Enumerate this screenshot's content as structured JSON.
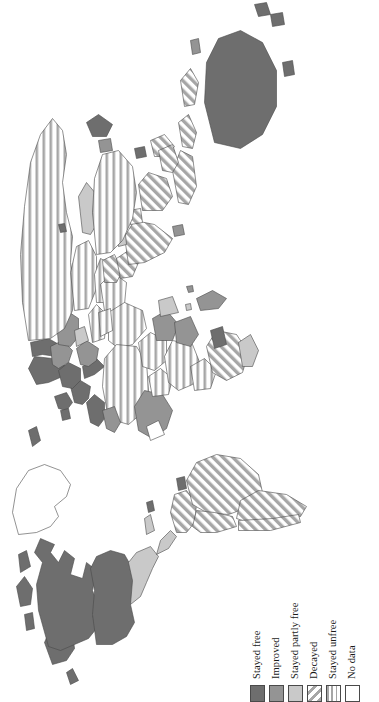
{
  "figure": {
    "type": "choropleth-world-map",
    "orientation": "rotated-90-ccw",
    "background_color": "#ffffff",
    "outline_color": "#4a4a4a"
  },
  "legend": {
    "name": "map-legend",
    "items": [
      {
        "label": "Stayed free",
        "fill": "solid",
        "color": "#6e6e6e"
      },
      {
        "label": "Improved",
        "fill": "solid",
        "color": "#949494"
      },
      {
        "label": "Stayed partly free",
        "fill": "solid",
        "color": "#c9c9c9"
      },
      {
        "label": "Decayed",
        "fill": "diagonal",
        "color": "#a0a0a0"
      },
      {
        "label": "Stayed unfree",
        "fill": "horizontal",
        "color": "#a0a0a0"
      },
      {
        "label": "No data",
        "fill": "none",
        "color": "#ffffff"
      }
    ]
  },
  "regions": [
    {
      "name": "canada",
      "category": "Stayed free"
    },
    {
      "name": "united-states",
      "category": "Stayed free"
    },
    {
      "name": "greenland",
      "category": "No data"
    },
    {
      "name": "mexico",
      "category": "Stayed partly free"
    },
    {
      "name": "central-america",
      "category": "Stayed partly free"
    },
    {
      "name": "brazil",
      "category": "Decayed"
    },
    {
      "name": "argentina",
      "category": "Decayed"
    },
    {
      "name": "chile",
      "category": "Decayed"
    },
    {
      "name": "western-europe",
      "category": "Stayed free"
    },
    {
      "name": "eastern-europe",
      "category": "Improved"
    },
    {
      "name": "russia",
      "category": "Stayed unfree"
    },
    {
      "name": "china",
      "category": "Stayed unfree"
    },
    {
      "name": "india",
      "category": "Decayed"
    },
    {
      "name": "north-africa",
      "category": "Stayed unfree"
    },
    {
      "name": "west-africa",
      "category": "Improved"
    },
    {
      "name": "central-africa",
      "category": "Stayed unfree"
    },
    {
      "name": "southern-africa",
      "category": "Decayed"
    },
    {
      "name": "middle-east",
      "category": "Stayed unfree"
    },
    {
      "name": "southeast-asia",
      "category": "Decayed"
    },
    {
      "name": "australia",
      "category": "Stayed free"
    },
    {
      "name": "new-zealand",
      "category": "Stayed free"
    },
    {
      "name": "japan",
      "category": "Stayed free"
    }
  ]
}
